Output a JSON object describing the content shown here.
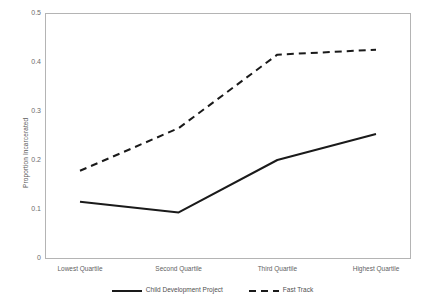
{
  "chart_data": {
    "type": "line",
    "title": "",
    "xlabel": "",
    "ylabel": "Proportion Incarcerated",
    "categories": [
      "Lowest Quartile",
      "Second Quartile",
      "Third Quartile",
      "Highest Quartile"
    ],
    "ylim": [
      0,
      0.5
    ],
    "yticks": [
      "0.5",
      "0.4",
      "0.3",
      "0.2",
      "0.1",
      "0"
    ],
    "ytick_values": [
      0.5,
      0.4,
      0.3,
      0.2,
      0.1,
      0
    ],
    "grid": false,
    "legend_position": "bottom",
    "series": [
      {
        "name": "Child Development Project",
        "style": "solid",
        "color": "#1a1a1a",
        "values": [
          0.115,
          0.093,
          0.2,
          0.253
        ]
      },
      {
        "name": "Fast Track",
        "style": "dashed",
        "color": "#1a1a1a",
        "values": [
          0.178,
          0.265,
          0.415,
          0.425
        ]
      }
    ]
  },
  "axes": {
    "y_title": "Proportion Incarcerated"
  },
  "legend": {
    "items": [
      {
        "label": "Child Development Project",
        "style": "solid"
      },
      {
        "label": "Fast Track",
        "style": "dashed"
      }
    ]
  }
}
